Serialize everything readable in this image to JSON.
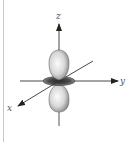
{
  "diagram": {
    "axes": [
      {
        "name": "z",
        "label": "z"
      },
      {
        "name": "y",
        "label": "y"
      },
      {
        "name": "x",
        "label": "x"
      }
    ],
    "colors": {
      "axis": "#333333",
      "lobe_light": "#f4f4f4",
      "lobe_dark": "#8a8a8a",
      "ring_dark": "#3a3a3a",
      "ring_light": "#9a9a9a",
      "border": "#c8c8c8"
    }
  }
}
